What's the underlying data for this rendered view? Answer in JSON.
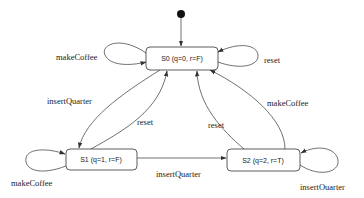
{
  "diagram": {
    "type": "state-machine",
    "initial_state": "S0",
    "states": [
      {
        "id": "S0",
        "label": "S0 (q=0, r=F)"
      },
      {
        "id": "S1",
        "label": "S1 (q=1, r=F)"
      },
      {
        "id": "S2",
        "label": "S2 (q=2, r=T)"
      }
    ],
    "transitions": [
      {
        "from": "S0",
        "to": "S0",
        "label": "makeCoffee"
      },
      {
        "from": "S0",
        "to": "S0",
        "label": "reset"
      },
      {
        "from": "S0",
        "to": "S1",
        "label": "insertQuarter"
      },
      {
        "from": "S1",
        "to": "S0",
        "label": "reset"
      },
      {
        "from": "S2",
        "to": "S0",
        "label": "reset"
      },
      {
        "from": "S2",
        "to": "S0",
        "label": "makeCoffee"
      },
      {
        "from": "S1",
        "to": "S1",
        "label": "makeCoffee"
      },
      {
        "from": "S1",
        "to": "S2",
        "label": "insertQuarter"
      },
      {
        "from": "S2",
        "to": "S2",
        "label": "insertOuarter"
      }
    ]
  }
}
